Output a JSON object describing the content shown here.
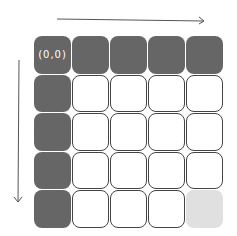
{
  "diagram": {
    "origin_label": "(0,0)",
    "rows": 5,
    "cols": 5,
    "cells": [
      [
        "dark",
        "dark",
        "dark",
        "dark",
        "dark"
      ],
      [
        "dark",
        "empty",
        "empty",
        "empty",
        "empty"
      ],
      [
        "dark",
        "empty",
        "empty",
        "empty",
        "empty"
      ],
      [
        "dark",
        "empty",
        "empty",
        "empty",
        "empty"
      ],
      [
        "dark",
        "empty",
        "empty",
        "empty",
        "light"
      ]
    ],
    "colors": {
      "dark": "#666666",
      "light": "#e0e0e0",
      "border": "#444444"
    },
    "arrows": [
      {
        "direction": "right",
        "position": "top"
      },
      {
        "direction": "down",
        "position": "left"
      }
    ]
  }
}
